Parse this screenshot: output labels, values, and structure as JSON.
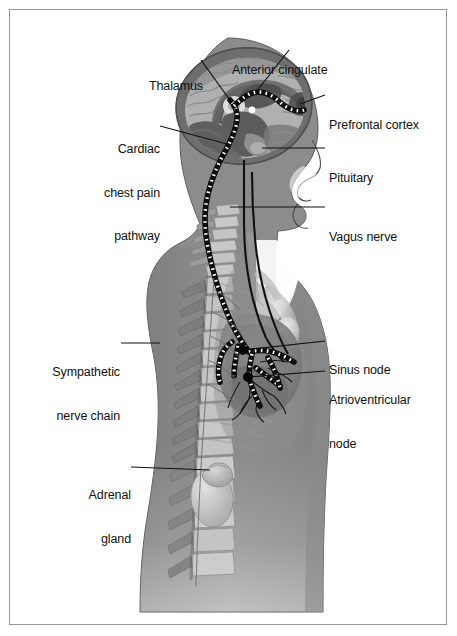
{
  "figure": {
    "border_color": "#9a9a9a",
    "background_color": "#ffffff",
    "label_color": "#111111"
  },
  "labels": [
    {
      "id": "thalamus",
      "text": "Thalamus",
      "lines": [
        "Thalamus"
      ],
      "side": "left",
      "text_x": 143,
      "text_y": 50,
      "leader": "M 201,60 L 232,103"
    },
    {
      "id": "anterior-cingulate",
      "text": "Anterior cingulate",
      "lines": [
        "Anterior cingulate"
      ],
      "side": "right",
      "text_x": 232,
      "text_y": 34,
      "leader": "M 289,50 L 256,92"
    },
    {
      "id": "prefrontal-cortex",
      "text": "Prefrontal cortex",
      "lines": [
        "Prefrontal cortex"
      ],
      "side": "right",
      "text_x": 329,
      "text_y": 89,
      "leader": "M 325,95 L 300,104"
    },
    {
      "id": "cardiac-chest-pain-pathway",
      "text": "Cardiac chest pain pathway",
      "lines": [
        "Cardiac",
        "chest pain",
        "pathway"
      ],
      "side": "left",
      "text_x": 105,
      "text_y": 113,
      "leader": "M 160,126 L 227,144"
    },
    {
      "id": "pituitary",
      "text": "Pituitary",
      "lines": [
        "Pituitary"
      ],
      "side": "right",
      "text_x": 329,
      "text_y": 142,
      "leader": "M 325,148 L 262,148"
    },
    {
      "id": "vagus-nerve",
      "text": "Vagus nerve",
      "lines": [
        "Vagus nerve"
      ],
      "side": "right",
      "text_x": 329,
      "text_y": 201,
      "leader": "M 325,207 L 230,207"
    },
    {
      "id": "sympathetic-nerve-chain",
      "text": "Sympathetic nerve chain",
      "lines": [
        "Sympathetic",
        "nerve chain"
      ],
      "side": "left",
      "text_x": 115,
      "text_y": 336,
      "leader": "M 121,343 L 160,343"
    },
    {
      "id": "sinus-node",
      "text": "Sinus node",
      "lines": [
        "Sinus node"
      ],
      "side": "right",
      "text_x": 329,
      "text_y": 334,
      "leader": "M 325,341 L 244,350"
    },
    {
      "id": "atrioventricular-node",
      "text": "Atrioventricular node",
      "lines": [
        "Atrioventricular",
        "node"
      ],
      "side": "right",
      "text_x": 329,
      "text_y": 364,
      "leader": "M 325,371 L 248,377"
    },
    {
      "id": "adrenal-gland",
      "text": "Adrenal gland",
      "lines": [
        "Adrenal",
        "gland"
      ],
      "side": "left",
      "text_x": 130,
      "text_y": 459,
      "leader": "M 131,467 L 210,470"
    }
  ],
  "anatomy": {
    "body_fill": "#8c8c8c",
    "body_stroke": "#4a4a4a",
    "brain_cortex": "#b5b5b5",
    "brain_deep": "#6f6f6f",
    "skull": "#7d7d7d",
    "bone": "#c9c9c9",
    "heart": "#7a7a7a",
    "lung": "#9e9e9e",
    "kidney": "#cfcfcf",
    "adrenal": "#bdbdbd",
    "nerve_black": "#141414",
    "pathway_dot_light": "#ffffff",
    "pathway_dot_dark": "#0d0d0d",
    "node_marker": "#000000",
    "structures": [
      "cranium",
      "cerebral-cortex",
      "corpus-callosum",
      "thalamus",
      "anterior-cingulate",
      "prefrontal-cortex",
      "cerebellum",
      "brainstem",
      "pituitary",
      "cervical-vertebrae",
      "thoracic-vertebrae",
      "lumbar-vertebrae",
      "ribs",
      "heart",
      "aorta",
      "sinus-node",
      "atrioventricular-node",
      "vagus-nerve",
      "sympathetic-chain",
      "kidney",
      "adrenal-gland"
    ]
  }
}
